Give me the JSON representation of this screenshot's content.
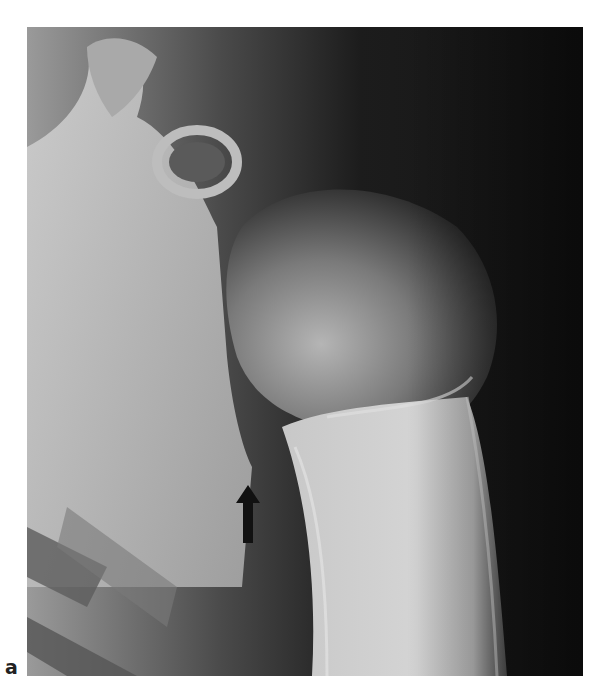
{
  "figure": {
    "panel_label": "a",
    "image_kind": "shoulder radiograph",
    "annotation": {
      "type": "arrow",
      "direction": "up",
      "color": "#111111"
    }
  },
  "colors": {
    "background": "#ffffff",
    "xray_dark": "#1a1a1a",
    "bone_light": "#d8d8d8"
  }
}
